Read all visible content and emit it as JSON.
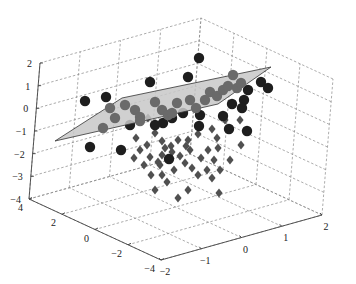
{
  "chart_data": {
    "type": "scatter3d",
    "title": "",
    "xlabel": "",
    "ylabel": "",
    "zlabel": "",
    "axes": {
      "x": {
        "range": [
          -2,
          2
        ],
        "ticks": [
          -2,
          -1,
          0,
          1,
          2
        ],
        "tick_labels": [
          "−2",
          "−1",
          "0",
          "1",
          "2"
        ]
      },
      "y": {
        "range": [
          -4,
          4
        ],
        "ticks": [
          -4,
          -2,
          0,
          2,
          4
        ],
        "tick_labels": [
          "−4",
          "−2",
          "0",
          "2",
          "4"
        ]
      },
      "z": {
        "range": [
          -4,
          2
        ],
        "ticks": [
          -4,
          -3,
          -2,
          -1,
          0,
          1,
          2
        ],
        "tick_labels": [
          "−4",
          "−3",
          "−2",
          "−1",
          "0",
          "1",
          "2"
        ]
      }
    },
    "grid": true,
    "legend": null,
    "plane": {
      "description": "separating plane (light gray, semi-transparent)",
      "color": "#c8c8c8",
      "screen_polygon": [
        [
          55,
          141
        ],
        [
          122,
          98
        ],
        [
          271,
          67
        ],
        [
          218,
          104
        ]
      ]
    },
    "series": [
      {
        "name": "class 1 (circles)",
        "marker": "circle",
        "color": "#1e1e1e",
        "color_behind_plane": "#6a6a6a",
        "screen_points": [
          [
            199,
            58
          ],
          [
            85,
            101
          ],
          [
            106,
            97
          ],
          [
            150,
            82
          ],
          [
            188,
            77
          ],
          [
            233,
            75
          ],
          [
            261,
            82
          ],
          [
            268,
            88
          ],
          [
            110,
            108
          ],
          [
            125,
            105
          ],
          [
            135,
            110
          ],
          [
            140,
            117
          ],
          [
            155,
            102
          ],
          [
            162,
            110
          ],
          [
            168,
            115
          ],
          [
            172,
            118
          ],
          [
            177,
            103
          ],
          [
            183,
            113
          ],
          [
            190,
            100
          ],
          [
            196,
            108
          ],
          [
            205,
            100
          ],
          [
            210,
            92
          ],
          [
            217,
            96
          ],
          [
            223,
            90
          ],
          [
            228,
            86
          ],
          [
            237,
            88
          ],
          [
            241,
            83
          ],
          [
            248,
            90
          ],
          [
            244,
            100
          ],
          [
            140,
            121
          ],
          [
            103,
            128
          ],
          [
            163,
            123
          ],
          [
            172,
            113
          ],
          [
            199,
            126
          ],
          [
            223,
            116
          ],
          [
            232,
            104
          ],
          [
            242,
            108
          ],
          [
            247,
            131
          ],
          [
            229,
            129
          ],
          [
            90,
            147
          ],
          [
            121,
            150
          ],
          [
            169,
            159
          ],
          [
            130,
            125
          ],
          [
            155,
            125
          ],
          [
            115,
            118
          ],
          [
            200,
            115
          ]
        ]
      },
      {
        "name": "class 2 (diamonds)",
        "marker": "diamond",
        "color": "#505050",
        "screen_points": [
          [
            148,
            118
          ],
          [
            225,
            120
          ],
          [
            212,
            129
          ],
          [
            217,
            138
          ],
          [
            188,
            140
          ],
          [
            198,
            134
          ],
          [
            136,
            138
          ],
          [
            147,
            145
          ],
          [
            155,
            133
          ],
          [
            162,
            141
          ],
          [
            165,
            148
          ],
          [
            171,
            146
          ],
          [
            178,
            140
          ],
          [
            172,
            152
          ],
          [
            162,
            155
          ],
          [
            168,
            158
          ],
          [
            180,
            156
          ],
          [
            186,
            146
          ],
          [
            190,
            150
          ],
          [
            201,
            158
          ],
          [
            208,
            150
          ],
          [
            214,
            160
          ],
          [
            218,
            148
          ],
          [
            140,
            150
          ],
          [
            150,
            157
          ],
          [
            158,
            162
          ],
          [
            144,
            165
          ],
          [
            134,
            158
          ],
          [
            151,
            175
          ],
          [
            162,
            175
          ],
          [
            192,
            168
          ],
          [
            198,
            175
          ],
          [
            188,
            190
          ],
          [
            219,
            193
          ],
          [
            155,
            190
          ],
          [
            167,
            182
          ],
          [
            178,
            198
          ],
          [
            240,
            120
          ],
          [
            241,
            145
          ],
          [
            160,
            165
          ],
          [
            174,
            170
          ],
          [
            185,
            163
          ],
          [
            207,
            170
          ],
          [
            212,
            178
          ],
          [
            230,
            160
          ],
          [
            220,
            170
          ]
        ]
      }
    ],
    "view": {
      "projection_screen_corners": {
        "x-2_y4_z-4": [
          29,
          199
        ],
        "x-2_y-4_z-4": [
          161,
          260
        ],
        "x2_y-4_z-4": [
          322,
          215
        ],
        "x2_y4_z-4": [
          190,
          154
        ],
        "x2_y4_z2": [
          201,
          18
        ]
      }
    }
  }
}
